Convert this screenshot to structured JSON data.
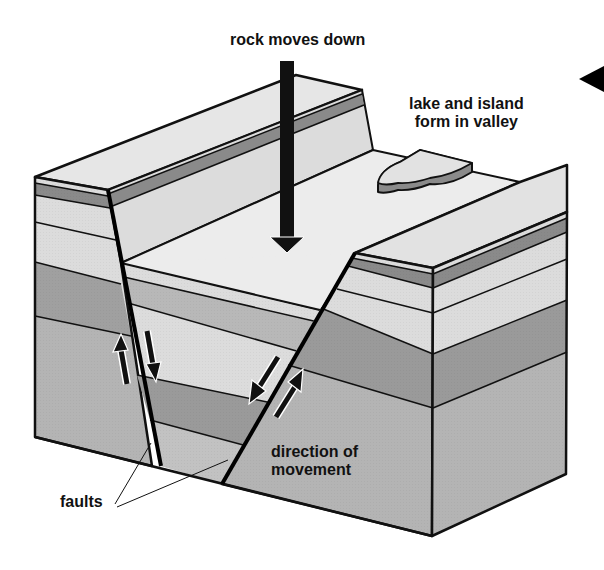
{
  "diagram": {
    "labels": {
      "rock_moves_down": "rock moves down",
      "lake_line1": "lake and island",
      "lake_line2": "form in valley",
      "direction_line1": "direction of",
      "direction_line2": "movement",
      "faults": "faults"
    },
    "icons": [
      "down-arrow-icon",
      "pointer-triangle-icon",
      "up-arrow-icon",
      "down-arrow-icon"
    ],
    "colors": {
      "outline": "#111111",
      "top_surface": "#e8e8e8",
      "light_layer": "#dcdcdc",
      "dark_band": "#8a8a8a",
      "mid_gray": "#b4b4b4",
      "dark_gray": "#9a9a9a",
      "background": "#ffffff"
    },
    "layers": [
      "top surface",
      "thin dark band",
      "light layer",
      "light layer",
      "dark gray layer",
      "medium gray base"
    ]
  }
}
